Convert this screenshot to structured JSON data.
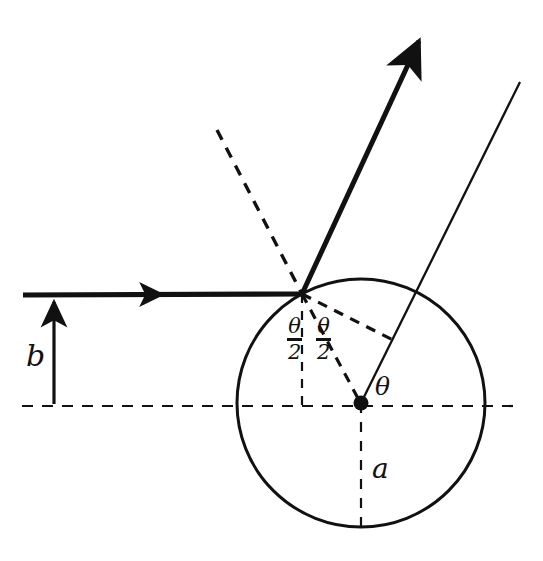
{
  "figure": {
    "kind": "hard-sphere-scattering-diagram",
    "background_color": "#ffffff",
    "stroke_color": "#111111",
    "labels": {
      "impact_parameter": "b",
      "sphere_radius": "a",
      "scattering_angle": "θ",
      "half_angle_left_numerator": "θ",
      "half_angle_left_denominator": "2",
      "half_angle_right_numerator": "θ",
      "half_angle_right_denominator": "2"
    }
  },
  "geometry": {
    "circle": {
      "cx": 361,
      "cy": 403,
      "r": 124
    },
    "center_dot": {
      "cx": 361,
      "cy": 403,
      "r": 7
    },
    "impact_point": {
      "x": 302,
      "y": 294
    },
    "incoming_ray": {
      "x1": 23,
      "y1": 295,
      "x2": 302,
      "y2": 294,
      "arrow_at_x": 150
    },
    "outgoing_ray": {
      "x1": 302,
      "y1": 294,
      "x2": 421,
      "y2": 37
    },
    "thin_line": {
      "x1": 361,
      "y1": 403,
      "x2": 520,
      "y2": 82
    },
    "dashed_normal": {
      "x1": 217,
      "y1": 130,
      "x2": 302,
      "y2": 294
    },
    "dashed_vertical_impact": {
      "x1": 302,
      "y1": 294,
      "x2": 302,
      "y2": 406
    },
    "dashed_impact_to_center": {
      "x1": 302,
      "y1": 294,
      "x2": 361,
      "y2": 403
    },
    "dashed_impact_to_thinline": {
      "x1": 302,
      "y1": 294,
      "x2": 394,
      "y2": 340
    },
    "dashed_axis": {
      "x1": 22,
      "y1": 406,
      "x2": 515,
      "y2": 406
    },
    "dashed_vertical_center": {
      "x1": 361,
      "y1": 403,
      "x2": 361,
      "y2": 528
    },
    "b_arrow": {
      "x": 54,
      "y_bottom": 401,
      "y_top": 299
    }
  },
  "label_positions": {
    "b": {
      "left": 26,
      "top": 341
    },
    "a": {
      "left": 372,
      "top": 455
    },
    "theta": {
      "left": 375,
      "top": 374
    },
    "half_left": {
      "left": 287,
      "top": 316
    },
    "half_right": {
      "left": 316,
      "top": 316
    }
  }
}
